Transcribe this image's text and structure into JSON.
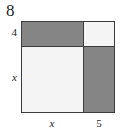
{
  "figure": {
    "kind": "area-model-square",
    "total_side_label": "8",
    "colors": {
      "shaded_fill": "#858585",
      "unshaded_fill": "#f4f4f4",
      "stroke": "#3d3d3d",
      "background": "#ffffff",
      "text": "#1f1f1f"
    },
    "side_labels": {
      "top_row": "4",
      "bottom_row": "x"
    },
    "bottom_labels": {
      "left_column": "x",
      "right_column": "5"
    },
    "cells": [
      {
        "position": "top-left",
        "shaded": true,
        "width_label": "x",
        "height_label": "4"
      },
      {
        "position": "top-right",
        "shaded": false,
        "width_label": "5",
        "height_label": "4"
      },
      {
        "position": "bottom-left",
        "shaded": false,
        "width_label": "x",
        "height_label": "x"
      },
      {
        "position": "bottom-right",
        "shaded": true,
        "width_label": "5",
        "height_label": "x"
      }
    ]
  }
}
